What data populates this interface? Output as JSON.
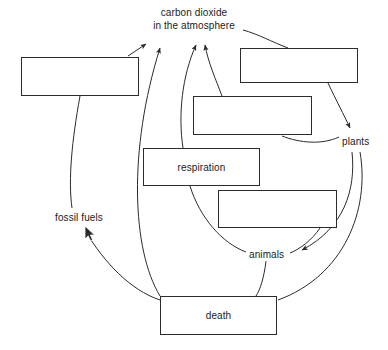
{
  "diagram": {
    "type": "carbon-cycle-flow-diagram",
    "title": {
      "line1": "carbon dioxide",
      "line2": "in the atmosphere"
    },
    "stroke_color": "#2b2b2b",
    "text_color": "#1a1a1a",
    "background_color": "#ffffff",
    "boxes": [
      {
        "id": "box-top-left",
        "label": "",
        "x": 21,
        "y": 57,
        "w": 118,
        "h": 39
      },
      {
        "id": "box-top-right",
        "label": "",
        "x": 240,
        "y": 48,
        "w": 118,
        "h": 35
      },
      {
        "id": "box-middle-upper",
        "label": "",
        "x": 193,
        "y": 96,
        "w": 119,
        "h": 39
      },
      {
        "id": "box-respiration",
        "label": "respiration",
        "x": 143,
        "y": 148,
        "w": 117,
        "h": 38
      },
      {
        "id": "box-middle-lower",
        "label": "",
        "x": 218,
        "y": 190,
        "w": 119,
        "h": 38
      },
      {
        "id": "box-death",
        "label": "death",
        "x": 160,
        "y": 296,
        "w": 117,
        "h": 39
      }
    ],
    "labels": [
      {
        "id": "label-fossil-fuels",
        "text": "fossil fuels",
        "x": 55,
        "y": 212
      },
      {
        "id": "label-plants",
        "text": "plants",
        "x": 342,
        "y": 136
      },
      {
        "id": "label-animals",
        "text": "animals",
        "x": 249,
        "y": 249
      }
    ],
    "cursor": {
      "x": 84,
      "y": 225
    }
  }
}
